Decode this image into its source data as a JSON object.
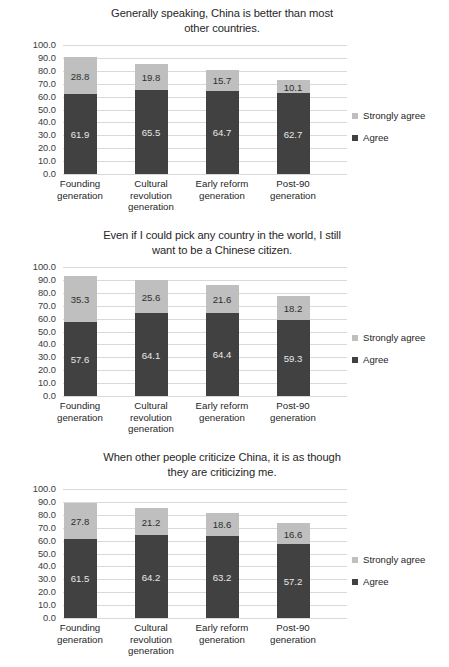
{
  "colors": {
    "agree": "#414141",
    "strongly_agree": "#bfbfbf",
    "gridline": "#d9d9d9",
    "text": "#262626",
    "background": "#ffffff"
  },
  "legend": {
    "items": [
      {
        "label": "Strongly agree",
        "color": "#bfbfbf"
      },
      {
        "label": "Agree",
        "color": "#414141"
      }
    ]
  },
  "axis": {
    "ticks": [
      "100.0",
      "90.0",
      "80.0",
      "70.0",
      "60.0",
      "50.0",
      "40.0",
      "30.0",
      "20.0",
      "10.0",
      "0.0"
    ]
  },
  "chart_data": [
    {
      "type": "bar",
      "stacked": true,
      "title": "Generally speaking, China is better than most other countries.",
      "title_lines": [
        "Generally speaking, China is better than most",
        "other countries."
      ],
      "categories": [
        "Founding generation",
        "Cultural revolution generation",
        "Early reform generation",
        "Post-90 generation"
      ],
      "category_lines": [
        [
          "Founding",
          "generation"
        ],
        [
          "Cultural",
          "revolution",
          "generation"
        ],
        [
          "Early reform",
          "generation"
        ],
        [
          "Post-90",
          "generation"
        ]
      ],
      "series": [
        {
          "name": "Agree",
          "values": [
            61.9,
            65.5,
            64.7,
            62.7
          ],
          "color": "#414141"
        },
        {
          "name": "Strongly agree",
          "values": [
            28.8,
            19.8,
            15.7,
            10.1
          ],
          "color": "#bfbfbf"
        }
      ],
      "xlabel": "",
      "ylabel": "",
      "ylim": [
        0,
        100
      ],
      "ytick_step": 10,
      "grid": true,
      "legend_position": "right"
    },
    {
      "type": "bar",
      "stacked": true,
      "title": "Even if I could pick any country in the world, I still want to be a Chinese citizen.",
      "title_lines": [
        "Even if I could pick any country in the world, I still",
        "want to be a Chinese citizen."
      ],
      "categories": [
        "Founding generation",
        "Cultural revolution generation",
        "Early reform generation",
        "Post-90 generation"
      ],
      "category_lines": [
        [
          "Founding",
          "generation"
        ],
        [
          "Cultural",
          "revolution",
          "generation"
        ],
        [
          "Early reform",
          "generation"
        ],
        [
          "Post-90",
          "generation"
        ]
      ],
      "series": [
        {
          "name": "Agree",
          "values": [
            57.6,
            64.1,
            64.4,
            59.3
          ],
          "color": "#414141"
        },
        {
          "name": "Strongly agree",
          "values": [
            35.3,
            25.6,
            21.6,
            18.2
          ],
          "color": "#bfbfbf"
        }
      ],
      "xlabel": "",
      "ylabel": "",
      "ylim": [
        0,
        100
      ],
      "ytick_step": 10,
      "grid": true,
      "legend_position": "right"
    },
    {
      "type": "bar",
      "stacked": true,
      "title": "When other people criticize China, it is as though they are criticizing me.",
      "title_lines": [
        "When other people criticize China, it is as though",
        "they are criticizing me."
      ],
      "categories": [
        "Founding generation",
        "Cultural revolution generation",
        "Early reform generation",
        "Post-90 generation"
      ],
      "category_lines": [
        [
          "Founding",
          "generation"
        ],
        [
          "Cultural",
          "revolution",
          "generation"
        ],
        [
          "Early reform",
          "generation"
        ],
        [
          "Post-90",
          "generation"
        ]
      ],
      "series": [
        {
          "name": "Agree",
          "values": [
            61.5,
            64.2,
            63.2,
            57.2
          ],
          "color": "#414141"
        },
        {
          "name": "Strongly agree",
          "values": [
            27.8,
            21.2,
            18.6,
            16.6
          ],
          "color": "#bfbfbf"
        }
      ],
      "xlabel": "",
      "ylabel": "",
      "ylim": [
        0,
        100
      ],
      "ytick_step": 10,
      "grid": true,
      "legend_position": "right"
    }
  ]
}
